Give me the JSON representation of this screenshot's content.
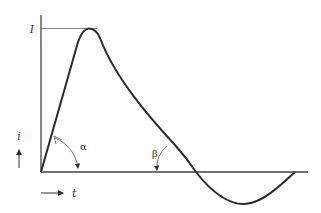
{
  "diagram": {
    "type": "current-waveform",
    "labels": {
      "peak": "I",
      "y_axis": "i",
      "x_axis": "t",
      "rise_angle": "α",
      "fall_angle": "β"
    },
    "colors": {
      "stroke": "#2a2a2a",
      "axis": "#444444",
      "annotation": "#555555",
      "background": "#ffffff"
    }
  }
}
